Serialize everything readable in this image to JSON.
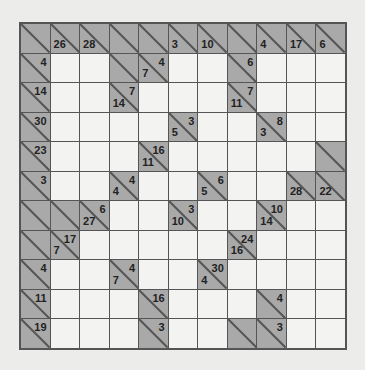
{
  "puzzle": {
    "type": "kakuro",
    "rows": 11,
    "cols": 11,
    "colors": {
      "clue_cell": "#a9a9a9",
      "empty_cell": "#f3f3f1",
      "grid_line": "#555555",
      "background": "#ececea"
    },
    "legend": "Each clue cell: down sum at bottom-left, across sum at top-right. Cell codes: W = white entry cell, X = shaded clue cell with no numbers, [down, across] = clue cell (null = no clue).",
    "grid": [
      [
        [
          "X"
        ],
        [
          26,
          null
        ],
        [
          28,
          null
        ],
        [
          "X"
        ],
        [
          "X"
        ],
        [
          3,
          null
        ],
        [
          10,
          null
        ],
        [
          "X"
        ],
        [
          4,
          null
        ],
        [
          17,
          null
        ],
        [
          6,
          null
        ]
      ],
      [
        [
          null,
          4
        ],
        "W",
        "W",
        [
          "X"
        ],
        [
          7,
          4
        ],
        "W",
        "W",
        [
          null,
          6
        ],
        "W",
        "W",
        "W"
      ],
      [
        [
          null,
          14
        ],
        "W",
        "W",
        [
          14,
          7
        ],
        "W",
        "W",
        "W",
        [
          11,
          7
        ],
        "W",
        "W",
        "W"
      ],
      [
        [
          null,
          30
        ],
        "W",
        "W",
        "W",
        "W",
        [
          5,
          3
        ],
        "W",
        "W",
        [
          3,
          8
        ],
        "W",
        "W"
      ],
      [
        [
          null,
          23
        ],
        "W",
        "W",
        "W",
        [
          11,
          16
        ],
        "W",
        "W",
        "W",
        "W",
        "W",
        [
          "X"
        ]
      ],
      [
        [
          null,
          3
        ],
        "W",
        "W",
        [
          4,
          4
        ],
        "W",
        "W",
        [
          5,
          6
        ],
        "W",
        "W",
        [
          28,
          null
        ],
        [
          22,
          null
        ]
      ],
      [
        [
          "X"
        ],
        [
          "X"
        ],
        [
          27,
          6
        ],
        "W",
        "W",
        [
          10,
          3
        ],
        "W",
        "W",
        [
          14,
          10
        ],
        "W",
        "W"
      ],
      [
        [
          "X"
        ],
        [
          7,
          17
        ],
        "W",
        "W",
        "W",
        "W",
        "W",
        [
          16,
          24
        ],
        "W",
        "W",
        "W"
      ],
      [
        [
          null,
          4
        ],
        "W",
        "W",
        [
          7,
          4
        ],
        "W",
        "W",
        [
          4,
          30
        ],
        "W",
        "W",
        "W",
        "W"
      ],
      [
        [
          null,
          11
        ],
        "W",
        "W",
        "W",
        [
          null,
          16
        ],
        "W",
        "W",
        "W",
        [
          null,
          4
        ],
        "W",
        "W"
      ],
      [
        [
          null,
          19
        ],
        "W",
        "W",
        "W",
        [
          null,
          3
        ],
        "W",
        "W",
        [
          "X"
        ],
        [
          null,
          3
        ],
        "W",
        "W"
      ]
    ]
  }
}
